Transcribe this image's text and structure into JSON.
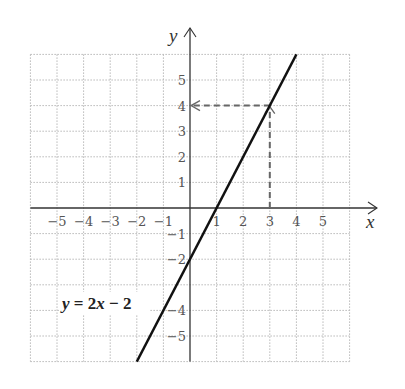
{
  "chart_data": {
    "type": "line",
    "title": "",
    "xlabel": "x",
    "ylabel": "y",
    "xlim": [
      -6,
      6
    ],
    "ylim": [
      -6,
      6
    ],
    "grid": true,
    "x_ticks": [
      -5,
      -4,
      -3,
      -2,
      -1,
      1,
      2,
      3,
      4,
      5
    ],
    "y_ticks": [
      5,
      4,
      3,
      2,
      1,
      -1,
      -2,
      -4,
      -5
    ],
    "x_tick_labels": [
      "−5",
      "−4",
      "−3",
      "−2",
      "−1",
      "1",
      "2",
      "3",
      "4",
      "5"
    ],
    "y_tick_labels": [
      "5",
      "4",
      "3",
      "2",
      "1",
      "−1",
      "−2",
      "−4",
      "−5"
    ],
    "series": [
      {
        "name": "y = 2x − 2",
        "equation": "y = 2x − 2",
        "slope": 2,
        "intercept": -2,
        "x": [
          -2,
          4
        ],
        "y": [
          -6,
          6
        ]
      }
    ],
    "annotations": [
      {
        "type": "dashed-guide",
        "from": [
          3,
          0
        ],
        "to": [
          3,
          4
        ],
        "arrow": "up",
        "description": "vertical dashed line from x=3 up to the line"
      },
      {
        "type": "dashed-guide",
        "from": [
          3,
          4
        ],
        "to": [
          0,
          4
        ],
        "arrow": "left",
        "description": "horizontal dashed line from the point (3, 4) left to y-axis at 4"
      }
    ],
    "highlight_point": [
      3,
      4
    ],
    "equation_label": "y = 2x − 2"
  },
  "labels": {
    "x_axis": "x",
    "y_axis": "y",
    "equation": {
      "y": "y",
      "eq": " = 2",
      "x": "x",
      "rest": " − 2"
    }
  },
  "colors": {
    "line": "#111111",
    "axis": "#333333",
    "grid": "#b8b8b8",
    "guide": "#666666"
  }
}
